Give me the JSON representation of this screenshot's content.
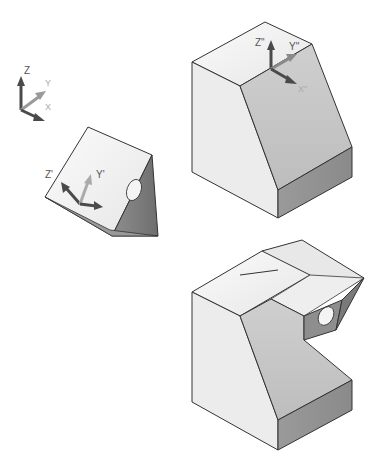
{
  "figure": {
    "world_ucs": {
      "axes": {
        "z": "Z",
        "y": "Y",
        "x": "X"
      },
      "colors": {
        "z": "#4a4a4a",
        "y": "#9a9a9a",
        "x": "#5a5a5a"
      }
    },
    "wedge": {
      "ucs_labels": {
        "z": "Z'",
        "y": "Y'"
      }
    },
    "block_top": {
      "ucs_labels": {
        "z": "Z\"",
        "y": "Y\"",
        "x": "X\""
      }
    },
    "block_combined": {
      "features": [
        "sloped block",
        "wedge attached with hole"
      ]
    },
    "colors": {
      "face_light": "#f2f2f2",
      "face_mid": "#d4d4d4",
      "face_dark": "#a8a8a8",
      "face_darker": "#8c8c8c",
      "edge": "#333333"
    }
  }
}
